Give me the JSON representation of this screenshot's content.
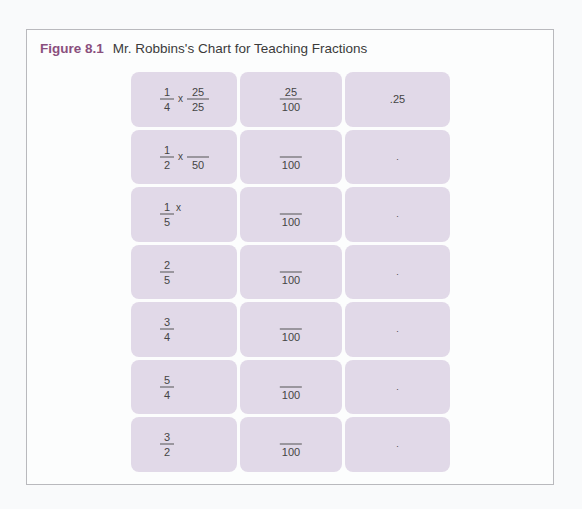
{
  "figure": {
    "number": "Figure 8.1",
    "title": "Mr. Robbins's Chart for Teaching Fractions"
  },
  "colors": {
    "figure_label": "#8a4f7d",
    "cell_fill": "#e1d9e8",
    "border": "#b9b9bd"
  },
  "rows": [
    {
      "col1": {
        "num": "1",
        "den": "4",
        "op": "x",
        "mult_num": "25",
        "mult_den": "25"
      },
      "col2": {
        "num": "25",
        "den": "100"
      },
      "col3": {
        "value": ".25"
      }
    },
    {
      "col1": {
        "num": "1",
        "den": "2",
        "op": "x",
        "mult_num": "",
        "mult_den": "50"
      },
      "col2": {
        "num": "",
        "den": "100"
      },
      "col3": {
        "value": "."
      }
    },
    {
      "col1": {
        "num": "1",
        "den": "5",
        "op": "x"
      },
      "col2": {
        "num": "",
        "den": "100"
      },
      "col3": {
        "value": "."
      }
    },
    {
      "col1": {
        "num": "2",
        "den": "5"
      },
      "col2": {
        "num": "",
        "den": "100"
      },
      "col3": {
        "value": "."
      }
    },
    {
      "col1": {
        "num": "3",
        "den": "4"
      },
      "col2": {
        "num": "",
        "den": "100"
      },
      "col3": {
        "value": "."
      }
    },
    {
      "col1": {
        "num": "5",
        "den": "4"
      },
      "col2": {
        "num": "",
        "den": "100"
      },
      "col3": {
        "value": "."
      }
    },
    {
      "col1": {
        "num": "3",
        "den": "2"
      },
      "col2": {
        "num": "",
        "den": "100"
      },
      "col3": {
        "value": "."
      }
    }
  ]
}
